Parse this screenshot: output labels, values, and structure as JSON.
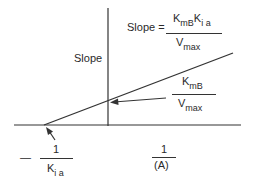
{
  "diagram": {
    "type": "secondary-plot",
    "y_axis_label": "Slope",
    "x_axis_label": {
      "numerator": "1",
      "denominator": "(A)"
    },
    "slope_equation": {
      "lhs": "Slope =",
      "numerator": {
        "K": "K",
        "K_sub": "m",
        "K_sub2": "B",
        "K2": "K",
        "K2_sub": "i a"
      },
      "denominator": {
        "V": "V",
        "V_sub": "max"
      }
    },
    "y_intercept_label": {
      "numerator": {
        "K": "K",
        "sub": "m",
        "sub2": "B"
      },
      "denominator": {
        "V": "V",
        "sub": "max"
      }
    },
    "x_intercept_label": {
      "sign": "—",
      "numerator": "1",
      "denominator": {
        "K": "K",
        "sub": "i a"
      }
    },
    "colors": {
      "line": "#333333",
      "background": "#ffffff"
    }
  }
}
